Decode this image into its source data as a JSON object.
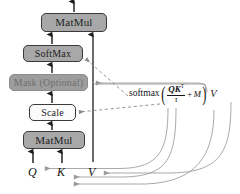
{
  "diagram": {
    "nodes": [
      {
        "id": "matmul_top",
        "label": "MatMul",
        "fill": "#a8a8a8"
      },
      {
        "id": "softmax",
        "label": "SoftMax",
        "fill": "#a8a8a8"
      },
      {
        "id": "mask",
        "label": "Mask (Optional)",
        "fill": "#9d9d9d"
      },
      {
        "id": "scale",
        "label": "Scale",
        "fill": "#fbfbfb"
      },
      {
        "id": "matmul_bot",
        "label": "MatMul",
        "fill": "#a8a8a8"
      }
    ],
    "inputs": [
      {
        "id": "q",
        "label": "Q"
      },
      {
        "id": "k",
        "label": "K"
      },
      {
        "id": "v",
        "label": "V"
      }
    ],
    "formula": {
      "function": "softmax",
      "open_paren": "(",
      "numerator": "QK",
      "numerator_sup": "T",
      "denominator": "τ",
      "plus": "+",
      "mask_symbol": "M",
      "close_paren": ")",
      "value_symbol": "V",
      "plain_text": "softmax( QK^T / τ + M ) V"
    },
    "colors": {
      "node_grey": "#a8a8a8",
      "node_mask_fill": "#9d9d9d",
      "node_mask_text": "#6e6e6e",
      "node_light": "#fbfbfb",
      "border": "#3a3a3a",
      "solid_arrow": "#1d1d1d",
      "dashed_link": "#8a8a8a",
      "curve_link": "#9a9a9a",
      "background": "#ffffff"
    }
  }
}
